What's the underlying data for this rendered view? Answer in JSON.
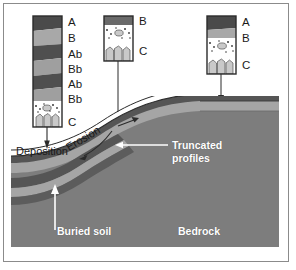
{
  "figure": {
    "kind": "geology-soil-cross-section-diagram",
    "background_color": "#ffffff",
    "frame_color": "#8b8b8b"
  },
  "palette": {
    "horizon_A_dark": "#4a4a4a",
    "horizon_B_light": "#a8a8a8",
    "horizon_Ab_dark": "#4f4f4f",
    "horizon_Bb_light": "#9f9f9f",
    "horizon_C_fill": "#ffffff",
    "rock_fragment": "#c9c9c9",
    "ground_main": "#7d7d7d",
    "ground_band_dark": "#555555",
    "ground_band_light": "#a5a5a5",
    "bedrock": "#7d7d7d",
    "outline": "#2b2b2b",
    "arrow": "#2b2b2b",
    "white_text": "#ffffff"
  },
  "profiles": [
    {
      "id": "left-profile",
      "name": "cumulative-buried-soil-profile",
      "description": "thick column of stacked buried A and B horizons over C",
      "horizons": [
        {
          "code": "A",
          "tone": "dark"
        },
        {
          "code": "B",
          "tone": "light"
        },
        {
          "code": "Ab",
          "tone": "dark"
        },
        {
          "code": "Bb",
          "tone": "light"
        },
        {
          "code": "Ab",
          "tone": "dark"
        },
        {
          "code": "Bb",
          "tone": "light"
        },
        {
          "code": "C",
          "tone": "rocky"
        }
      ]
    },
    {
      "id": "middle-profile",
      "name": "truncated-soil-profile",
      "description": "thin B horizon directly over C horizon",
      "horizons": [
        {
          "code": "B",
          "tone": "dark"
        },
        {
          "code": "C",
          "tone": "rocky"
        }
      ]
    },
    {
      "id": "right-profile",
      "name": "intact-soil-profile",
      "description": "A over B over C horizon on stable summit",
      "horizons": [
        {
          "code": "A",
          "tone": "dark"
        },
        {
          "code": "B",
          "tone": "light"
        },
        {
          "code": "C",
          "tone": "rocky"
        }
      ]
    }
  ],
  "labels": {
    "left_profile": [
      "A",
      "B",
      "Ab",
      "Bb",
      "Ab",
      "Bb",
      "C"
    ],
    "middle_profile": [
      "B",
      "C"
    ],
    "right_profile": [
      "A",
      "B",
      "C"
    ],
    "deposition": "Deposition",
    "erosion": "Erosion",
    "truncated_line1": "Truncated",
    "truncated_line2": "profiles",
    "buried_soil": "Buried soil",
    "bedrock": "Bedrock"
  },
  "annotations": [
    {
      "name": "deposition-callout",
      "text": "Deposition",
      "points_to": "toeslope-deposition-zone"
    },
    {
      "name": "erosion-callout",
      "text": "Erosion",
      "rotated": true,
      "points_to": "backslope-erosion-zone"
    },
    {
      "name": "truncated-profiles-callout",
      "text": "Truncated profiles",
      "points_to": "backslope-surface"
    },
    {
      "name": "buried-soil-callout",
      "text": "Buried soil",
      "points_to": "buried-soil-band"
    },
    {
      "name": "bedrock-callout",
      "text": "Bedrock",
      "points_to": "bedrock-body"
    }
  ],
  "connectors": [
    {
      "name": "left-profile-connector",
      "from": "left-profile",
      "to": "toeslope-deposition-zone"
    },
    {
      "name": "middle-profile-connector",
      "from": "middle-profile",
      "to": "backslope-surface"
    },
    {
      "name": "right-profile-connector",
      "from": "right-profile",
      "to": "summit-surface"
    }
  ]
}
